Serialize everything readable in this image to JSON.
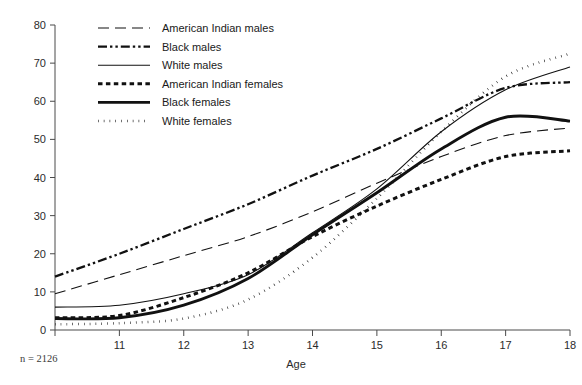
{
  "chart_data": {
    "type": "line",
    "title": "",
    "xlabel": "Age",
    "ylabel": "",
    "xlim": [
      10,
      18
    ],
    "ylim": [
      0,
      80
    ],
    "grid": false,
    "legend_position": "top-left",
    "x": [
      10,
      11,
      12,
      13,
      14,
      15,
      16,
      17,
      18
    ],
    "x_ticks": [
      "",
      "11",
      "12",
      "13",
      "14",
      "15",
      "16",
      "17",
      "18"
    ],
    "y_ticks": [
      "0",
      "10",
      "20",
      "30",
      "40",
      "50",
      "60",
      "70",
      "80"
    ],
    "annotation": "n = 2126",
    "series": [
      {
        "name": "American Indian males",
        "style": "dashed",
        "values": [
          9.5,
          14.5,
          19.5,
          24.5,
          31.0,
          38.5,
          45.5,
          51.0,
          53.0
        ]
      },
      {
        "name": "Black males",
        "style": "dash-dot-dot",
        "values": [
          14.0,
          20.0,
          26.5,
          33.0,
          40.5,
          47.5,
          55.5,
          63.5,
          65.0
        ]
      },
      {
        "name": "White males",
        "style": "solid-thin",
        "values": [
          6.0,
          6.5,
          9.5,
          14.5,
          25.5,
          37.0,
          52.0,
          63.0,
          69.0
        ]
      },
      {
        "name": "American Indian females",
        "style": "dotted-thick",
        "values": [
          3.2,
          3.8,
          8.5,
          15.0,
          24.5,
          32.5,
          39.5,
          45.5,
          47.0
        ]
      },
      {
        "name": "Black females",
        "style": "solid-thick",
        "values": [
          3.0,
          3.2,
          6.5,
          13.5,
          25.0,
          36.0,
          47.5,
          55.8,
          54.8
        ]
      },
      {
        "name": "White females",
        "style": "dotted-thin",
        "values": [
          1.5,
          1.8,
          3.0,
          8.0,
          19.0,
          34.5,
          52.0,
          66.5,
          72.5
        ]
      }
    ]
  },
  "legend": {
    "entries": [
      {
        "label": "American Indian males"
      },
      {
        "label": "Black males"
      },
      {
        "label": "White males"
      },
      {
        "label": "American Indian females"
      },
      {
        "label": "Black females"
      },
      {
        "label": "White females"
      }
    ]
  },
  "axes": {
    "x_title": "Age"
  },
  "footnote": {
    "text": "n = 2126"
  }
}
